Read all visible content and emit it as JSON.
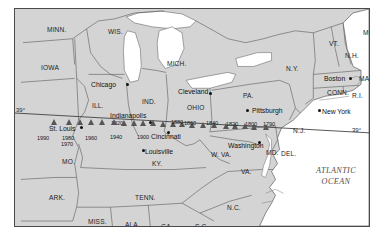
{
  "map": {
    "title": "Movement of the center of U.S. population",
    "projection_note": "39 degrees north latitude reference line",
    "colors": {
      "land": "#d4d4d4",
      "water": "#ffffff",
      "border": "#4a4a4a",
      "marker": "#565656",
      "text": "#1c1c1c",
      "ocean_text": "#4f4f4f"
    },
    "latitude_labels": [
      {
        "text": "39",
        "degree": "°",
        "side": "left"
      },
      {
        "text": "39",
        "degree": "°",
        "side": "right"
      }
    ],
    "ocean_label": {
      "line1": "ATLANTIC",
      "line2": "OCEAN"
    }
  },
  "states": [
    {
      "label": "MINN.",
      "x": 32,
      "y": 18
    },
    {
      "label": "WIS.",
      "x": 93,
      "y": 20
    },
    {
      "label": "IOWA",
      "x": 26,
      "y": 56
    },
    {
      "label": "MICH.",
      "x": 152,
      "y": 52
    },
    {
      "label": "ILL.",
      "x": 77,
      "y": 94
    },
    {
      "label": "IND.",
      "x": 127,
      "y": 90
    },
    {
      "label": "OHIO",
      "x": 172,
      "y": 96
    },
    {
      "label": "PA.",
      "x": 228,
      "y": 84
    },
    {
      "label": "N.Y.",
      "x": 271,
      "y": 57
    },
    {
      "label": "VT.",
      "x": 314,
      "y": 32
    },
    {
      "label": "N.H.",
      "x": 330,
      "y": 44
    },
    {
      "label": "ME.",
      "x": 348,
      "y": 21
    },
    {
      "label": "MASS.",
      "x": 344,
      "y": 67
    },
    {
      "label": "CONN.",
      "x": 312,
      "y": 81
    },
    {
      "label": "R.I.",
      "x": 337,
      "y": 84
    },
    {
      "label": "N.J.",
      "x": 278,
      "y": 119
    },
    {
      "label": "MD.",
      "x": 251,
      "y": 141
    },
    {
      "label": "DEL.",
      "x": 266,
      "y": 142
    },
    {
      "label": "W. VA.",
      "x": 196,
      "y": 143
    },
    {
      "label": "VA.",
      "x": 226,
      "y": 160
    },
    {
      "label": "KY.",
      "x": 137,
      "y": 152
    },
    {
      "label": "MO.",
      "x": 47,
      "y": 150
    },
    {
      "label": "TENN.",
      "x": 120,
      "y": 186
    },
    {
      "label": "ARK.",
      "x": 34,
      "y": 186
    },
    {
      "label": "MISS.",
      "x": 73,
      "y": 210
    },
    {
      "label": "ALA.",
      "x": 110,
      "y": 213
    },
    {
      "label": "GA.",
      "x": 146,
      "y": 215
    },
    {
      "label": "S.C.",
      "x": 180,
      "y": 215
    },
    {
      "label": "N.C.",
      "x": 212,
      "y": 196
    }
  ],
  "cities": [
    {
      "label": "Chicago",
      "lx": 76,
      "ly": 73,
      "dx": 111,
      "dy": 74
    },
    {
      "label": "Cleveland",
      "lx": 163,
      "ly": 80,
      "dx": 194,
      "dy": 83
    },
    {
      "label": "Pittsburgh",
      "lx": 237,
      "ly": 99,
      "dx": 231,
      "dy": 100
    },
    {
      "label": "Boston",
      "lx": 309,
      "ly": 67,
      "dx": 334,
      "dy": 68
    },
    {
      "label": "New York",
      "lx": 307,
      "ly": 100,
      "dx": 303,
      "dy": 100
    },
    {
      "label": "Indianapolis",
      "lx": 95,
      "ly": 104,
      "dx": 134,
      "dy": 112
    },
    {
      "label": "St. Louis",
      "lx": 34,
      "ly": 117,
      "dx": 65,
      "dy": 117
    },
    {
      "label": "Cincinnati",
      "lx": 136,
      "ly": 125,
      "dx": 152,
      "dy": 122
    },
    {
      "label": "Louisville",
      "lx": 130,
      "ly": 140,
      "dx": 127,
      "dy": 140
    },
    {
      "label": "Washington",
      "lx": 213,
      "ly": 134,
      "dx": 243,
      "dy": 132
    }
  ],
  "population_center": {
    "description": "Decennial center of U.S. population markers",
    "markers": [
      {
        "year": "1790",
        "x": 252,
        "y": 122,
        "label_x": 248,
        "label_y": 113
      },
      {
        "year": "1800",
        "x": 240,
        "y": 122,
        "label_x": 230,
        "label_y": 113
      },
      {
        "year": "1810",
        "x": 231,
        "y": 121,
        "label_x": 0,
        "label_y": 0
      },
      {
        "year": "1820",
        "x": 221,
        "y": 121,
        "label_x": 211,
        "label_y": 113
      },
      {
        "year": "1830",
        "x": 212,
        "y": 121,
        "label_x": 0,
        "label_y": 0
      },
      {
        "year": "1840",
        "x": 200,
        "y": 120,
        "label_x": 191,
        "label_y": 112
      },
      {
        "year": "1850",
        "x": 189,
        "y": 120,
        "label_x": 0,
        "label_y": 0
      },
      {
        "year": "1860",
        "x": 178,
        "y": 120,
        "label_x": 169,
        "label_y": 112
      },
      {
        "year": "1870",
        "x": 168,
        "y": 119,
        "label_x": 0,
        "label_y": 0
      },
      {
        "year": "1880",
        "x": 159,
        "y": 119,
        "label_x": 156,
        "label_y": 111
      },
      {
        "year": "1890",
        "x": 149,
        "y": 119,
        "label_x": 0,
        "label_y": 0
      },
      {
        "year": "1900",
        "x": 139,
        "y": 118,
        "label_x": 122,
        "label_y": 126
      },
      {
        "year": "1910",
        "x": 129,
        "y": 118,
        "label_x": 0,
        "label_y": 0
      },
      {
        "year": "1920",
        "x": 120,
        "y": 118,
        "label_x": 96,
        "label_y": 112
      },
      {
        "year": "1930",
        "x": 110,
        "y": 118,
        "label_x": 0,
        "label_y": 0
      },
      {
        "year": "1940",
        "x": 100,
        "y": 117,
        "label_x": 95,
        "label_y": 126
      },
      {
        "year": "1950",
        "x": 88,
        "y": 117,
        "label_x": 0,
        "label_y": 0
      },
      {
        "year": "1960",
        "x": 77,
        "y": 117,
        "label_x": 70,
        "label_y": 127
      },
      {
        "year": "1970",
        "x": 66,
        "y": 117,
        "label_x": 46,
        "label_y": 133
      },
      {
        "year": "1980",
        "x": 55,
        "y": 117,
        "label_x": 47,
        "label_y": 127
      },
      {
        "year": "1990",
        "x": 40,
        "y": 117,
        "label_x": 22,
        "label_y": 127
      }
    ]
  }
}
